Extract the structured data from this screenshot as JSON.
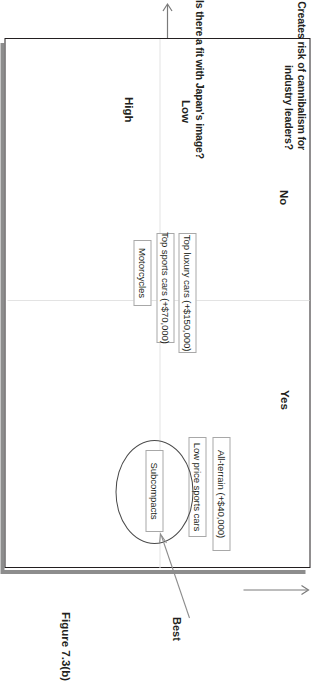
{
  "figure": {
    "caption": "Figure 7.3(b)",
    "type": "two-by-two-matrix"
  },
  "axes": {
    "column_axis": {
      "title": "Creates risk of cannibalism for industry leaders?",
      "categories": [
        "No",
        "Yes"
      ]
    },
    "row_axis": {
      "title": "Is there a fit with Japan's image?",
      "categories": [
        "Low",
        "High"
      ]
    }
  },
  "cells": {
    "no_low": {
      "items": [
        "Top luxury cars (+$150,000)",
        "Top sports cars (+$70,000)",
        "Motorcycles"
      ]
    },
    "yes_high": {
      "items": [
        "All-terrain (+$40,000)",
        "Low price sports cars",
        "Subcompacts"
      ]
    }
  },
  "annotation": {
    "best_label": "Best",
    "best_target": "Subcompacts"
  },
  "colors": {
    "text": "#231f20",
    "box_border": "#a8a8a8",
    "frame_border": "#231f20",
    "frame_shadow": "#8d8d8d",
    "grid_divider": "#e3e3e3",
    "ellipse": "#4a4a4a",
    "leader_line": "#8d8d8d",
    "background": "#ffffff"
  }
}
